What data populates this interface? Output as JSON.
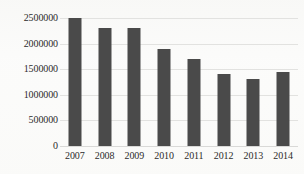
{
  "chart_data": {
    "type": "bar",
    "title": "",
    "subtitle": "",
    "xlabel": "",
    "ylabel": "",
    "categories": [
      "2007",
      "2008",
      "2009",
      "2010",
      "2011",
      "2012",
      "2013",
      "2014"
    ],
    "values": [
      2500000,
      2300000,
      2300000,
      1900000,
      1700000,
      1400000,
      1300000,
      1450000
    ],
    "series": [
      {
        "name": "",
        "values": [
          2500000,
          2300000,
          2300000,
          1900000,
          1700000,
          1400000,
          1300000,
          1450000
        ]
      }
    ],
    "ylim": [
      0,
      2500000
    ],
    "ytick_values": [
      0,
      500000,
      1000000,
      1500000,
      2000000,
      2500000
    ],
    "ytick_labels": [
      "0",
      "500000",
      "1000000",
      "1500000",
      "2000000",
      "2500000"
    ],
    "xtick_labels": [
      "2007",
      "2008",
      "2009",
      "2010",
      "2011",
      "2012",
      "2013",
      "2014"
    ],
    "grid": true,
    "grid_axis": "y",
    "legend": false,
    "legend_position": "none",
    "annotations": [],
    "colors": {
      "bar": "#4a4a4a",
      "gridline": "#e2e2e0",
      "axis": "#d9d9d7",
      "text": "#2b2b2b",
      "background": "#fbfbfa"
    }
  }
}
